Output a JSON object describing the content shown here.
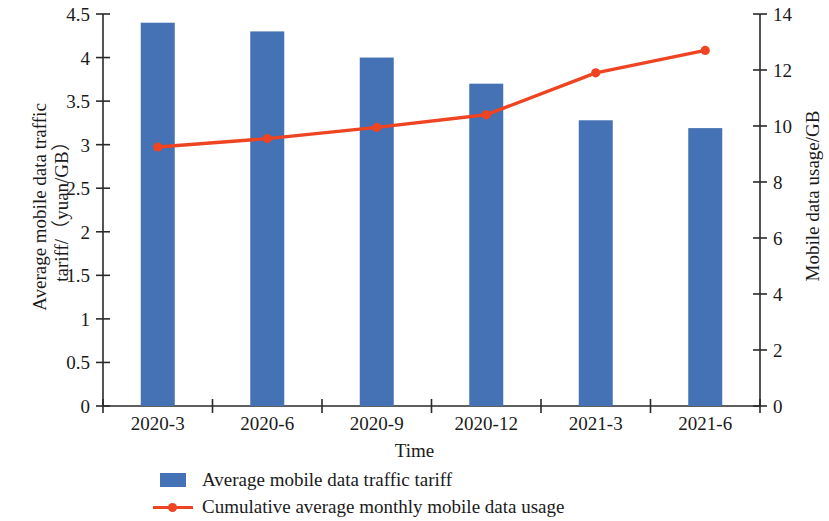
{
  "chart_data": {
    "type": "bar",
    "title": "",
    "categories": [
      "2020-3",
      "2020-6",
      "2020-9",
      "2020-12",
      "2021-3",
      "2021-6"
    ],
    "xlabel": "Time",
    "grid": false,
    "legend_position": "bottom",
    "series": [
      {
        "name": "Average mobile data traffic tariff",
        "type": "bar",
        "axis": "left",
        "color": "#4472b4",
        "values": [
          4.4,
          4.3,
          4.0,
          3.7,
          3.28,
          3.19
        ]
      },
      {
        "name": "Cumulative average monthly mobile data usage",
        "type": "line",
        "axis": "right",
        "color": "#ee4422",
        "values": [
          9.25,
          9.55,
          9.95,
          10.4,
          11.9,
          12.7
        ]
      }
    ],
    "y_left": {
      "label": "Average mobile data traffic\ntariff/（yuan/GB）",
      "ticks": [
        "0",
        "0.5",
        "1",
        "1.5",
        "2",
        "2.5",
        "3",
        "3.5",
        "4",
        "4.5"
      ],
      "ylim": [
        0,
        4.5
      ]
    },
    "y_right": {
      "label": "Mobile data usage/GB",
      "ticks": [
        "0",
        "2",
        "4",
        "6",
        "8",
        "10",
        "12",
        "14"
      ],
      "ylim": [
        0,
        14
      ]
    }
  },
  "legend": {
    "items": [
      {
        "label": "Average mobile data traffic tariff",
        "marker": "bar-swatch",
        "color": "#4472b4"
      },
      {
        "label": "Cumulative average monthly mobile data usage",
        "marker": "line-marker",
        "color": "#ee4422"
      }
    ]
  }
}
